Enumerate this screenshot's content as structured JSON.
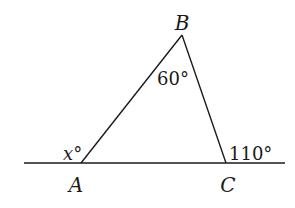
{
  "diagram": {
    "type": "triangle-exterior-angle",
    "colors": {
      "stroke": "#1a1a1a",
      "background": "#ffffff"
    },
    "points": {
      "A": {
        "label": "A",
        "x": 81,
        "y": 163
      },
      "B": {
        "label": "B",
        "x": 182,
        "y": 35
      },
      "C": {
        "label": "C",
        "x": 226,
        "y": 163
      }
    },
    "baseline": {
      "x1": 24,
      "x2": 285,
      "y": 163
    },
    "angles": {
      "at_B": {
        "text": "60°"
      },
      "at_A": {
        "var": "x",
        "deg": "°"
      },
      "exterior_C": {
        "text": "110°"
      }
    }
  }
}
